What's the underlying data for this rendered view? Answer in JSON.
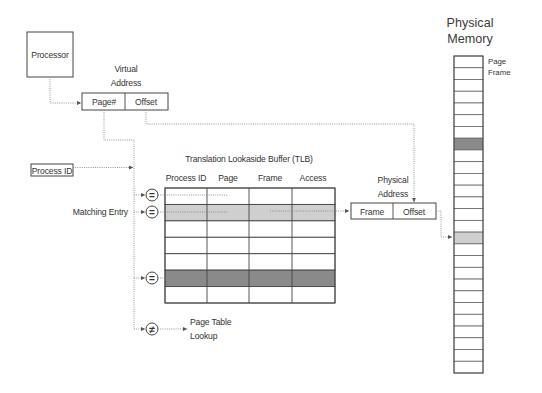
{
  "diagram": {
    "processor": {
      "label": "Processor"
    },
    "virtual_address": {
      "title_line1": "Virtual",
      "title_line2": "Address",
      "page_label": "Page#",
      "offset_label": "Offset"
    },
    "process_id": {
      "label": "Process ID"
    },
    "matching_entry": {
      "label": "Matching Entry"
    },
    "tlb": {
      "title": "Translation Lookaside Buffer (TLB)",
      "columns": [
        "Process ID",
        "Page",
        "Frame",
        "Access"
      ],
      "rows": [
        {
          "shade": "none",
          "compared": true,
          "symbol": "="
        },
        {
          "shade": "light",
          "compared": true,
          "symbol": "=",
          "matching": true
        },
        {
          "shade": "none",
          "compared": false
        },
        {
          "shade": "none",
          "compared": false
        },
        {
          "shade": "none",
          "compared": false
        },
        {
          "shade": "dark",
          "compared": true,
          "symbol": "="
        },
        {
          "shade": "none",
          "compared": false
        }
      ],
      "miss_symbol": "≠"
    },
    "page_table_lookup": {
      "line1": "Page Table",
      "line2": "Lookup"
    },
    "physical_address": {
      "title_line1": "Physical",
      "title_line2": "Address",
      "frame_label": "Frame",
      "offset_label": "Offset"
    },
    "physical_memory": {
      "title_line1": "Physical",
      "title_line2": "Memory",
      "frame_label_line1": "Page",
      "frame_label_line2": "Frame",
      "frame_count": 27,
      "highlighted_frames": [
        {
          "index": 7,
          "shade": "dark"
        },
        {
          "index": 15,
          "shade": "light"
        }
      ]
    }
  },
  "colors": {
    "light_shade": "#cfcfcf",
    "dark_shade": "#8a8a8a",
    "line": "#444444",
    "connector": "#8a8a8a"
  }
}
